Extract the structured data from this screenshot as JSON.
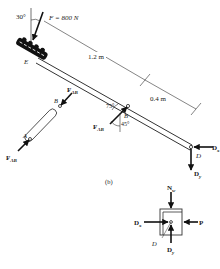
{
  "figure": {
    "caption": "(b)",
    "member_DE": {
      "force_label": "F = 800 N",
      "angle_label": "30°",
      "point_E": "E",
      "point_B": "B",
      "point_D": "D",
      "length_1": "1.2 m",
      "length_2": "0.4 m",
      "angle_75": "75°",
      "angle_45": "45°",
      "force_AB": "F",
      "force_AB_sub": "AB",
      "force_Dx": "D",
      "force_Dx_sub": "x",
      "force_Dy": "D",
      "force_Dy_sub": "y"
    },
    "member_AB": {
      "point_A": "A",
      "point_B": "B",
      "force_top": "F",
      "force_top_sub": "AB",
      "force_bottom": "F",
      "force_bottom_sub": "AB"
    },
    "collar": {
      "force_N": "N",
      "force_N_sub": "w",
      "force_Dx": "D",
      "force_Dx_sub": "x",
      "force_Dy": "D",
      "force_Dy_sub": "y",
      "force_P": "P",
      "point_D": "D"
    }
  }
}
